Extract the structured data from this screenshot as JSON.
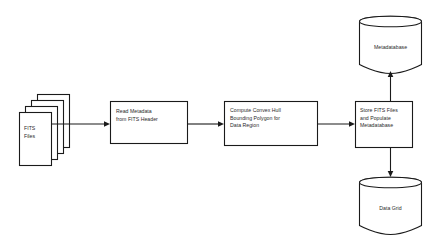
{
  "diagram": {
    "type": "flowchart",
    "background_color": "#ffffff",
    "stroke_color": "#1a1a1a",
    "text_color": "#2b2b2b",
    "nodes": [
      {
        "id": "fits-files",
        "shape": "multi-document-stack",
        "label": "FITS\nFiles",
        "align": "left",
        "pages": 4
      },
      {
        "id": "read-metadata",
        "shape": "rectangle",
        "label": "Read Metadata\nfrom FITS Header",
        "align": "left"
      },
      {
        "id": "compute-convex-hull",
        "shape": "rectangle",
        "label": "Compute Convex Hull\nBounding Polygon for\nData Region",
        "align": "left"
      },
      {
        "id": "store-fits-files",
        "shape": "rectangle",
        "label": "Store FITS Files\nand Populate\nMetadatabase",
        "align": "left"
      },
      {
        "id": "metadatabase",
        "shape": "cylinder",
        "label": "Metadatabase",
        "align": "center"
      },
      {
        "id": "data-grid",
        "shape": "cylinder",
        "label": "Data Grid",
        "align": "center"
      }
    ],
    "edges": [
      {
        "id": "edge-files-to-read",
        "from": "fits-files",
        "to": "read-metadata",
        "direction": "right"
      },
      {
        "id": "edge-read-to-compute",
        "from": "read-metadata",
        "to": "compute-convex-hull",
        "direction": "right"
      },
      {
        "id": "edge-compute-to-store",
        "from": "compute-convex-hull",
        "to": "store-fits-files",
        "direction": "right"
      },
      {
        "id": "edge-store-to-metadatabase",
        "from": "store-fits-files",
        "to": "metadatabase",
        "direction": "up"
      },
      {
        "id": "edge-store-to-datagrid",
        "from": "store-fits-files",
        "to": "data-grid",
        "direction": "down"
      }
    ]
  }
}
